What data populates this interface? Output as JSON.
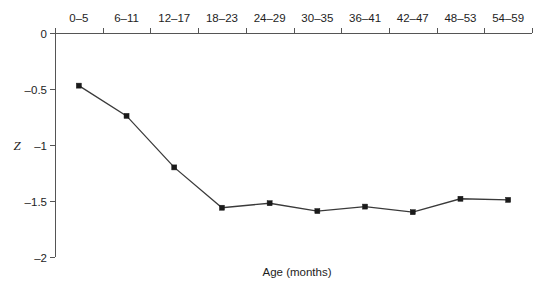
{
  "chart_data": {
    "type": "line",
    "title": "",
    "xlabel": "Age (months)",
    "ylabel": "Z",
    "categories": [
      "0–5",
      "6–11",
      "12–17",
      "18–23",
      "24–29",
      "30–35",
      "36–41",
      "42–47",
      "48–53",
      "54–59"
    ],
    "values": [
      -0.47,
      -0.74,
      -1.2,
      -1.56,
      -1.52,
      -1.59,
      -1.55,
      -1.6,
      -1.48,
      -1.49
    ],
    "series": [
      {
        "name": "Z-score",
        "values": [
          -0.47,
          -0.74,
          -1.2,
          -1.56,
          -1.52,
          -1.59,
          -1.55,
          -1.6,
          -1.48,
          -1.49
        ]
      }
    ],
    "ylim": [
      -2,
      0
    ],
    "yticks": [
      0,
      -0.5,
      -1,
      -1.5,
      -2
    ],
    "ytick_labels": [
      "0",
      "–0.5",
      "–1",
      "–1.5",
      "–2"
    ],
    "grid": false,
    "legend": false,
    "legend_position": "none",
    "xaxis_position": "top",
    "marker": "square",
    "line_color": "#3a3a3a",
    "marker_color": "#1a1a1a",
    "background_color": "#ffffff",
    "axis_color": "#555555"
  }
}
